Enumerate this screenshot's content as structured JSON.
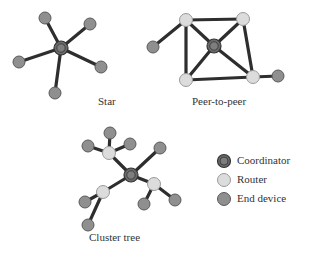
{
  "labels": {
    "star": "Star",
    "peer": "Peer-to-peer",
    "cluster": "Cluster tree"
  },
  "legend": {
    "coordinator": "Coordinator",
    "router": "Router",
    "end_device": "End device"
  },
  "colors": {
    "edge": "#2e2e2e",
    "coordinator": "#6a6a6a",
    "router": "#dcdcdc",
    "end_device": "#8f8f8f"
  },
  "topologies": {
    "star": {
      "coordinator": [
        61,
        48
      ],
      "routers": [],
      "end_devices": [
        [
          45,
          18
        ],
        [
          90,
          24
        ],
        [
          19,
          62
        ],
        [
          101,
          67
        ],
        [
          55,
          93
        ]
      ],
      "edges": [
        [
          [
            61,
            48
          ],
          [
            45,
            18
          ]
        ],
        [
          [
            61,
            48
          ],
          [
            90,
            24
          ]
        ],
        [
          [
            61,
            48
          ],
          [
            19,
            62
          ]
        ],
        [
          [
            61,
            48
          ],
          [
            101,
            67
          ]
        ],
        [
          [
            61,
            48
          ],
          [
            55,
            93
          ]
        ]
      ]
    },
    "peer_to_peer": {
      "coordinator": [
        214,
        46
      ],
      "routers": [
        [
          186,
          20
        ],
        [
          243,
          19
        ],
        [
          186,
          80
        ],
        [
          253,
          77
        ]
      ],
      "end_devices": [
        [
          153,
          47
        ],
        [
          278,
          76
        ]
      ],
      "edges": [
        [
          [
            186,
            20
          ],
          [
            243,
            19
          ]
        ],
        [
          [
            186,
            20
          ],
          [
            186,
            80
          ]
        ],
        [
          [
            243,
            19
          ],
          [
            253,
            77
          ]
        ],
        [
          [
            186,
            80
          ],
          [
            253,
            77
          ]
        ],
        [
          [
            186,
            20
          ],
          [
            214,
            46
          ]
        ],
        [
          [
            243,
            19
          ],
          [
            214,
            46
          ]
        ],
        [
          [
            186,
            80
          ],
          [
            214,
            46
          ]
        ],
        [
          [
            253,
            77
          ],
          [
            214,
            46
          ]
        ],
        [
          [
            153,
            47
          ],
          [
            186,
            20
          ]
        ],
        [
          [
            253,
            77
          ],
          [
            278,
            76
          ]
        ]
      ]
    },
    "cluster_tree": {
      "coordinator": [
        131,
        175
      ],
      "routers": [
        [
          109,
          153
        ],
        [
          103,
          192
        ],
        [
          154,
          184
        ]
      ],
      "end_devices": [
        [
          110,
          133
        ],
        [
          88,
          146
        ],
        [
          130,
          144
        ],
        [
          160,
          148
        ],
        [
          85,
          202
        ],
        [
          88,
          225
        ],
        [
          144,
          204
        ],
        [
          175,
          200
        ]
      ],
      "edges": [
        [
          [
            131,
            175
          ],
          [
            109,
            153
          ]
        ],
        [
          [
            131,
            175
          ],
          [
            103,
            192
          ]
        ],
        [
          [
            131,
            175
          ],
          [
            154,
            184
          ]
        ],
        [
          [
            131,
            175
          ],
          [
            160,
            148
          ]
        ],
        [
          [
            109,
            153
          ],
          [
            110,
            133
          ]
        ],
        [
          [
            109,
            153
          ],
          [
            88,
            146
          ]
        ],
        [
          [
            109,
            153
          ],
          [
            130,
            144
          ]
        ],
        [
          [
            103,
            192
          ],
          [
            85,
            202
          ]
        ],
        [
          [
            103,
            192
          ],
          [
            88,
            225
          ]
        ],
        [
          [
            154,
            184
          ],
          [
            144,
            204
          ]
        ],
        [
          [
            154,
            184
          ],
          [
            175,
            200
          ]
        ]
      ]
    }
  }
}
